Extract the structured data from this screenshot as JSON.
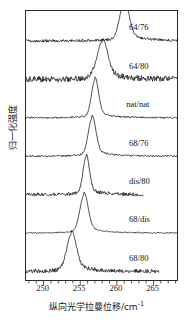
{
  "figure": {
    "title": "",
    "background": "#ffffff",
    "line_color": "#151515",
    "axis_color": "#2b2b2b"
  },
  "axes": {
    "xlabel_cjk": "纵向光学拉曼位移/cm",
    "xlabel_exponent": "-1",
    "ylabel_cjk": "归一化强度",
    "xtick_labels": [
      "250",
      "255",
      "260",
      "265"
    ],
    "xtick_values": [
      250,
      255,
      260,
      265
    ],
    "xlim": [
      247.6,
      268.2
    ],
    "minor_tick_step": 1,
    "grid": "off",
    "ytick_labels": []
  },
  "chart_data": {
    "type": "line",
    "title": "",
    "xlabel": "纵向光学拉曼位移/cm-1",
    "ylabel": "归一化强度",
    "xlim": [
      247.6,
      268.2
    ],
    "ylim": [
      0,
      7.2
    ],
    "grid": false,
    "legend_position": "inline-right",
    "series": [
      {
        "name": "64/76",
        "label": "64/76",
        "offset_index": 6,
        "peak_center": 261.0,
        "peak_height": 1.0,
        "fwhm": 1.5,
        "noise": 0.035,
        "x_start": 247.6,
        "x_end": 268.2,
        "label_x": 261.8,
        "baseline_tilt": 0.0
      },
      {
        "name": "64/80",
        "label": "64/80",
        "offset_index": 5,
        "peak_center": 258.0,
        "peak_height": 1.0,
        "fwhm": 1.7,
        "noise": 0.075,
        "x_start": 247.6,
        "x_end": 268.2,
        "label_x": 261.8,
        "baseline_tilt": 0.0
      },
      {
        "name": "nat/nat",
        "label": "nat/nat",
        "offset_index": 4,
        "peak_center": 257.0,
        "peak_height": 1.0,
        "fwhm": 1.1,
        "noise": 0.02,
        "x_start": 247.6,
        "x_end": 268.2,
        "label_x": 261.4,
        "baseline_tilt": 0.0
      },
      {
        "name": "68/76",
        "label": "68/76",
        "offset_index": 3,
        "peak_center": 256.6,
        "peak_height": 1.0,
        "fwhm": 1.2,
        "noise": 0.022,
        "x_start": 247.6,
        "x_end": 268.2,
        "label_x": 261.8,
        "baseline_tilt": 0.0
      },
      {
        "name": "dis/80",
        "label": "dis/80",
        "offset_index": 2,
        "peak_center": 255.8,
        "peak_height": 1.0,
        "fwhm": 1.0,
        "noise": 0.045,
        "x_start": 247.6,
        "x_end": 263.6,
        "label_x": 261.8,
        "baseline_tilt": 0.0
      },
      {
        "name": "68/dis",
        "label": "68/dis",
        "offset_index": 1,
        "peak_center": 255.5,
        "peak_height": 1.0,
        "fwhm": 1.3,
        "noise": 0.015,
        "x_start": 247.6,
        "x_end": 268.2,
        "label_x": 261.8,
        "baseline_tilt": 0.0
      },
      {
        "name": "68/80",
        "label": "68/80",
        "offset_index": 0,
        "peak_center": 253.8,
        "peak_height": 1.0,
        "fwhm": 1.5,
        "noise": 0.05,
        "x_start": 247.6,
        "x_end": 265.8,
        "label_x": 261.8,
        "baseline_tilt": 0.0
      }
    ]
  }
}
